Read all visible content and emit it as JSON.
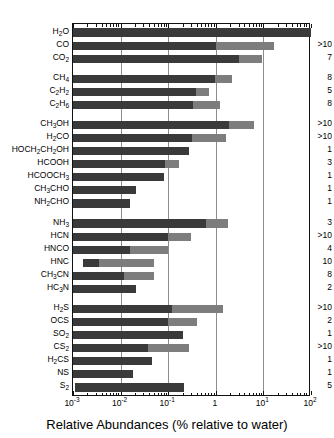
{
  "chart_data": {
    "type": "bar",
    "orientation": "horizontal",
    "title": "",
    "xlabel": "Relative Abundances (% relative to water)",
    "ylabel": "",
    "xscale": "log",
    "xlim": [
      0.001,
      100
    ],
    "xticks": [
      0.001,
      0.01,
      0.1,
      1,
      10,
      100
    ],
    "xticklabels": [
      "10-3",
      "10-2",
      "10-1",
      "1",
      "101",
      "102"
    ],
    "grid": "vertical-major",
    "legend": "none",
    "note": "Each bar spans the observed range of abundance; dark segment is the lower part of the range, light-grey segment the upper part. Right-hand column gives the number of comets measured.",
    "right_column_header": "",
    "categories": [
      "H2O",
      "CO",
      "CO2",
      "CH4",
      "C2H2",
      "C2H6",
      "CH3OH",
      "H2CO",
      "HOCH2CH2OH",
      "HCOOH",
      "HCOOCH3",
      "CH3CHO",
      "NH2CHO",
      "NH3",
      "HCN",
      "HNCO",
      "HNC",
      "CH3CN",
      "HC3N",
      "H2S",
      "OCS",
      "SO2",
      "CS2",
      "H2CS",
      "NS",
      "S2"
    ],
    "category_labels_html": [
      "H<sub>2</sub>O",
      "CO",
      "CO<sub>2</sub>",
      "CH<sub>4</sub>",
      "C<sub>2</sub>H<sub>2</sub>",
      "C<sub>2</sub>H<sub>6</sub>",
      "CH<sub>3</sub>OH",
      "H<sub>2</sub>CO",
      "HOCH<sub>2</sub>CH<sub>2</sub>OH",
      "HCOOH",
      "HCOOCH<sub>3</sub>",
      "CH<sub>3</sub>CHO",
      "NH<sub>2</sub>CHO",
      "NH<sub>3</sub>",
      "HCN",
      "HNCO",
      "HNC",
      "CH<sub>3</sub>CN",
      "HC<sub>3</sub>N",
      "H<sub>2</sub>S",
      "OCS",
      "SO<sub>2</sub>",
      "CS<sub>2</sub>",
      "H<sub>2</sub>CS",
      "NS",
      "S<sub>2</sub>"
    ],
    "group_breaks_after": [
      "CO2",
      "C2H6",
      "NH2CHO",
      "HC3N"
    ],
    "bars": [
      {
        "species": "H2O",
        "dark_start": 0.001,
        "dark_end": 100.0,
        "light_end": 100.0,
        "count": ""
      },
      {
        "species": "CO",
        "dark_start": 0.001,
        "dark_end": 1.0,
        "light_end": 17.0,
        "count": ">10"
      },
      {
        "species": "CO2",
        "dark_start": 0.001,
        "dark_end": 3.0,
        "light_end": 9.5,
        "count": "7"
      },
      {
        "species": "CH4",
        "dark_start": 0.001,
        "dark_end": 0.95,
        "light_end": 2.2,
        "count": "8"
      },
      {
        "species": "C2H2",
        "dark_start": 0.001,
        "dark_end": 0.38,
        "light_end": 0.72,
        "count": "5"
      },
      {
        "species": "C2H6",
        "dark_start": 0.001,
        "dark_end": 0.33,
        "light_end": 1.2,
        "count": "8"
      },
      {
        "species": "CH3OH",
        "dark_start": 0.001,
        "dark_end": 1.9,
        "light_end": 6.5,
        "count": ">10"
      },
      {
        "species": "H2CO",
        "dark_start": 0.001,
        "dark_end": 0.32,
        "light_end": 1.6,
        "count": ">10"
      },
      {
        "species": "HOCH2CH2OH",
        "dark_start": 0.001,
        "dark_end": 0.27,
        "light_end": 0.27,
        "count": "1"
      },
      {
        "species": "HCOOH",
        "dark_start": 0.001,
        "dark_end": 0.085,
        "light_end": 0.17,
        "count": "3"
      },
      {
        "species": "HCOOCH3",
        "dark_start": 0.001,
        "dark_end": 0.08,
        "light_end": 0.08,
        "count": "1"
      },
      {
        "species": "CH3CHO",
        "dark_start": 0.001,
        "dark_end": 0.021,
        "light_end": 0.021,
        "count": "1"
      },
      {
        "species": "NH2CHO",
        "dark_start": 0.001,
        "dark_end": 0.016,
        "light_end": 0.016,
        "count": "1"
      },
      {
        "species": "NH3",
        "dark_start": 0.001,
        "dark_end": 0.62,
        "light_end": 1.8,
        "count": "3"
      },
      {
        "species": "HCN",
        "dark_start": 0.001,
        "dark_end": 0.1,
        "light_end": 0.3,
        "count": ">10"
      },
      {
        "species": "HNCO",
        "dark_start": 0.001,
        "dark_end": 0.016,
        "light_end": 0.1,
        "count": "4"
      },
      {
        "species": "HNC",
        "dark_start": 0.0016,
        "dark_end": 0.0035,
        "light_end": 0.05,
        "count": "10"
      },
      {
        "species": "CH3CN",
        "dark_start": 0.001,
        "dark_end": 0.012,
        "light_end": 0.05,
        "count": "8"
      },
      {
        "species": "HC3N",
        "dark_start": 0.001,
        "dark_end": 0.021,
        "light_end": 0.021,
        "count": "2"
      },
      {
        "species": "H2S",
        "dark_start": 0.001,
        "dark_end": 0.12,
        "light_end": 1.45,
        "count": ">10"
      },
      {
        "species": "OCS",
        "dark_start": 0.001,
        "dark_end": 0.1,
        "light_end": 0.4,
        "count": "2"
      },
      {
        "species": "SO2",
        "dark_start": 0.001,
        "dark_end": 0.2,
        "light_end": 0.2,
        "count": "1"
      },
      {
        "species": "CS2",
        "dark_start": 0.001,
        "dark_end": 0.037,
        "light_end": 0.28,
        "count": ">10"
      },
      {
        "species": "H2CS",
        "dark_start": 0.001,
        "dark_end": 0.045,
        "light_end": 0.045,
        "count": "1"
      },
      {
        "species": "NS",
        "dark_start": 0.001,
        "dark_end": 0.018,
        "light_end": 0.018,
        "count": "1"
      },
      {
        "species": "S2",
        "dark_start": 0.0011,
        "dark_end": 0.22,
        "light_end": 0.22,
        "count": "5"
      }
    ]
  },
  "colors": {
    "bar_dark": "#3a3a3a",
    "bar_light": "#7d7d7d",
    "grid": "#8c8c8c",
    "axis": "#111111",
    "background": "#ffffff"
  }
}
